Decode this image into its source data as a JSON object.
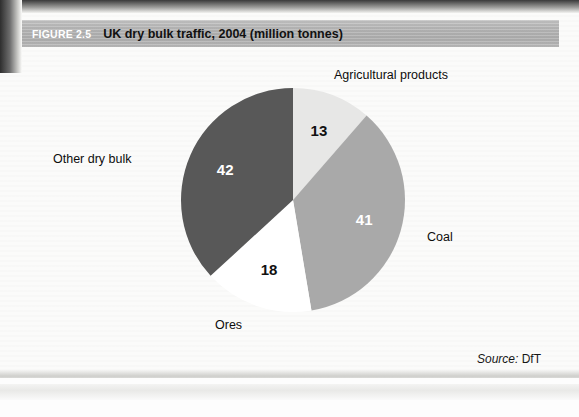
{
  "banner": {
    "figure_number": "FIGURE 2.5",
    "title": "UK dry bulk traffic, 2004 (million tonnes)",
    "background_color": "#b4b4b4",
    "number_color": "#ffffff",
    "title_color": "#111111"
  },
  "source": {
    "label": "Source:",
    "value": "DfT",
    "full": "Source: DfT"
  },
  "labels": {
    "agricultural": "Agricultural products",
    "coal": "Coal",
    "ores": "Ores",
    "other": "Other dry bulk"
  },
  "values": {
    "agricultural": "13",
    "coal": "41",
    "ores": "18",
    "other": "42"
  },
  "chart_data": {
    "type": "pie",
    "title": "UK dry bulk traffic, 2004 (million tonnes)",
    "figure_number": "FIGURE 2.5",
    "unit": "million tonnes",
    "year": 2004,
    "total": 114,
    "start_angle_deg": 0,
    "direction": "clockwise",
    "legend": "none",
    "labels_placement": "outside-callout-text",
    "categories": [
      "Agricultural products",
      "Coal",
      "Ores",
      "Other dry bulk"
    ],
    "values": [
      13,
      41,
      18,
      42
    ],
    "percentages": [
      11.4,
      36.0,
      15.8,
      36.8
    ],
    "colors": [
      "#e7e7e6",
      "#a9a9a9",
      "#ffffff",
      "#585858"
    ],
    "value_label_colors": [
      "#111111",
      "#ffffff",
      "#111111",
      "#ffffff"
    ],
    "source": "DfT",
    "slices": [
      {
        "name": "Agricultural products",
        "value": 13,
        "color": "#e7e7e6",
        "value_color": "#111111"
      },
      {
        "name": "Coal",
        "value": 41,
        "color": "#a9a9a9",
        "value_color": "#ffffff"
      },
      {
        "name": "Ores",
        "value": 18,
        "color": "#ffffff",
        "value_color": "#111111"
      },
      {
        "name": "Other dry bulk",
        "value": 42,
        "color": "#585858",
        "value_color": "#ffffff"
      }
    ]
  }
}
